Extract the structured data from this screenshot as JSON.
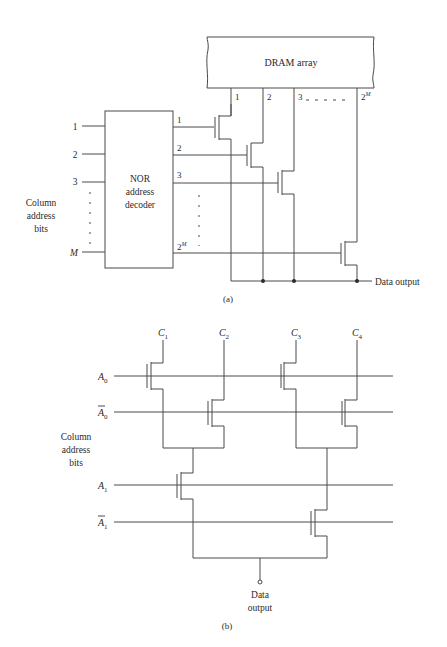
{
  "part_a": {
    "caption": "(a)",
    "dram_label": "DRAM array",
    "decoder_label": [
      "NOR",
      "address",
      "decoder"
    ],
    "side_label": [
      "Column",
      "address",
      "bits"
    ],
    "inputs": [
      "1",
      "2",
      "3",
      "M"
    ],
    "decoder_outputs": [
      "1",
      "2",
      "3",
      "2^M"
    ],
    "column_labels": [
      "1",
      "2",
      "3",
      "2^M"
    ],
    "output_label": "Data output"
  },
  "part_b": {
    "caption": "(b)",
    "columns": [
      "C1",
      "C2",
      "C3",
      "C4"
    ],
    "address_lines": [
      "A0",
      "A0̄",
      "A1",
      "A1̄"
    ],
    "side_label": [
      "Column",
      "address",
      "bits"
    ],
    "output_label": [
      "Data",
      "output"
    ]
  }
}
